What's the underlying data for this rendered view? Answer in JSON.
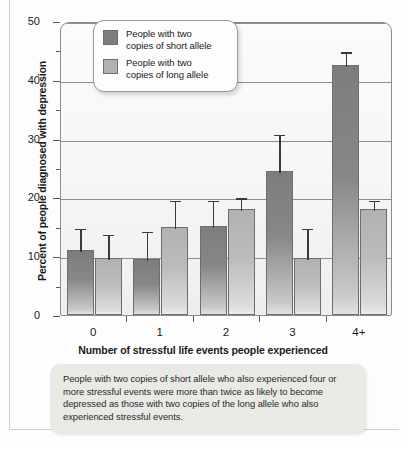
{
  "chart_data": {
    "type": "bar",
    "title": "",
    "xlabel": "Number of stressful life events people experienced",
    "ylabel": "Percent of people diagnosed with depression",
    "categories": [
      "0",
      "1",
      "2",
      "3",
      "4+"
    ],
    "ylim": [
      0,
      50
    ],
    "yticks": [
      0,
      10,
      20,
      30,
      40,
      50
    ],
    "yticks_minor": [
      5,
      15,
      25,
      35,
      45
    ],
    "grid": true,
    "legend_position": "top-left-inside",
    "series": [
      {
        "name": "People with two copies of short allele",
        "color": "#7d7d7d",
        "values": [
          11.0,
          9.5,
          15.2,
          24.5,
          42.5
        ],
        "error_upper": [
          15.0,
          14.5,
          19.8,
          31.0,
          45.0
        ]
      },
      {
        "name": "People with two copies of long allele",
        "color": "#b2b2b2",
        "values": [
          9.7,
          15.0,
          18.0,
          9.7,
          18.0
        ],
        "error_upper": [
          14.0,
          19.8,
          20.2,
          15.0,
          19.8
        ]
      }
    ]
  },
  "legend": {
    "items": [
      {
        "label_line1": "People with two",
        "label_line2": "copies of short allele",
        "color": "#7d7d7d"
      },
      {
        "label_line1": "People with two",
        "label_line2": "copies of long allele",
        "color": "#b2b2b2"
      }
    ]
  },
  "caption": {
    "text": "People with two copies of short allele who also experienced four or more stressful events were more than twice as likely to become depressed as those with two copies of the long allele who also experienced stressful events."
  }
}
